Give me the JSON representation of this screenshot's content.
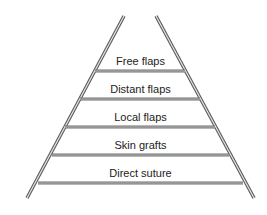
{
  "diagram": {
    "type": "reconstructive-ladder",
    "rungs": [
      {
        "label": "Free flaps"
      },
      {
        "label": "Distant flaps"
      },
      {
        "label": "Local flaps"
      },
      {
        "label": "Skin grafts"
      },
      {
        "label": "Direct suture"
      }
    ],
    "colors": {
      "rail": "#8a8a8a",
      "rail_edge": "#5a5a5a",
      "text": "#222222",
      "background": "#ffffff"
    }
  }
}
